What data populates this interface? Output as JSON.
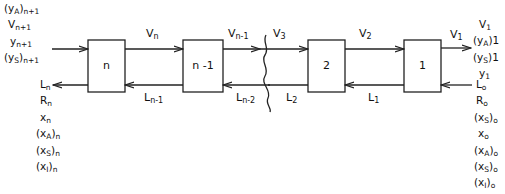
{
  "stages": [
    {
      "id": "n",
      "label": "n",
      "x": 88,
      "y": 40,
      "w": 37,
      "h": 52
    },
    {
      "id": "n-1",
      "label": "n -1",
      "x": 183,
      "y": 40,
      "w": 40,
      "h": 52
    },
    {
      "id": "2",
      "label": "2",
      "x": 308,
      "y": 40,
      "w": 37,
      "h": 52
    },
    {
      "id": "1",
      "label": "1",
      "x": 404,
      "y": 40,
      "w": 37,
      "h": 52
    }
  ],
  "vapor_streams": [
    {
      "base": "V",
      "sub": "n"
    },
    {
      "base": "V",
      "sub": "n-1"
    },
    {
      "base": "V",
      "sub": "3"
    },
    {
      "base": "V",
      "sub": "2"
    },
    {
      "base": "V",
      "sub": "1"
    }
  ],
  "liquid_streams": [
    {
      "base": "L",
      "sub": "n-1"
    },
    {
      "base": "L",
      "sub": "n-2"
    },
    {
      "base": "L",
      "sub": "2"
    },
    {
      "base": "L",
      "sub": "1"
    }
  ],
  "left_inlet_labels": [
    {
      "base": "(y",
      "subA": "A",
      "close": ")",
      "sub": "n+1"
    },
    {
      "base": "V",
      "sub": "n+1"
    },
    {
      "base": "y",
      "sub": "n+1"
    },
    {
      "base": "(y",
      "subA": "S",
      "close": ")",
      "sub": "n+1"
    }
  ],
  "left_outlet_labels": [
    {
      "base": "L",
      "sub": "n"
    },
    {
      "base": "R",
      "sub": "n"
    },
    {
      "base": "x",
      "sub": "n"
    },
    {
      "base": "(x",
      "subA": "A",
      "close": ")",
      "sub": "n"
    },
    {
      "base": "(x",
      "subA": "S",
      "close": ")",
      "sub": "n"
    },
    {
      "base": "(x",
      "subA": "I",
      "close": ")",
      "sub": "n"
    }
  ],
  "right_outlet_labels": [
    {
      "base": "V",
      "sub": "1"
    },
    {
      "base": "(y",
      "subA": "A",
      "close": ")",
      "sub": "1"
    },
    {
      "base": "(y",
      "subA": "S",
      "close": ")",
      "sub": "1"
    },
    {
      "base": "y",
      "sub": "1"
    }
  ],
  "right_inlet_labels": [
    {
      "base": "L",
      "sub": "o"
    },
    {
      "base": "R",
      "sub": "o"
    },
    {
      "base": "(x",
      "subA": "S",
      "close": ")",
      "sub": "o"
    },
    {
      "base": "x",
      "sub": "o"
    },
    {
      "base": "(x",
      "subA": "A",
      "close": ")",
      "sub": "o"
    },
    {
      "base": "(x",
      "subA": "S",
      "close": ")",
      "sub": "o"
    },
    {
      "base": "(x",
      "subA": "I",
      "close": ")",
      "sub": "o"
    }
  ],
  "colors": {
    "line": "#222222",
    "background": "#ffffff"
  }
}
